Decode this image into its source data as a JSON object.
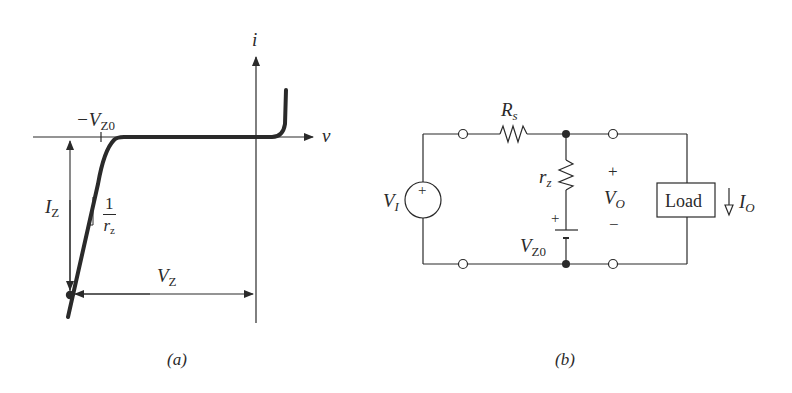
{
  "figure": {
    "panel_a": {
      "caption": "(a)",
      "axis_i_label": "i",
      "axis_v_label": "v",
      "knee_label_prefix": "−V",
      "knee_label_sub": "Z0",
      "current_label": "I",
      "current_label_sub": "Z",
      "slope_numerator": "1",
      "slope_denominator": "r",
      "slope_denominator_sub": "z",
      "voltage_label": "V",
      "voltage_label_sub": "Z"
    },
    "panel_b": {
      "caption": "(b)",
      "series_resistor": "R",
      "series_resistor_sub": "s",
      "zener_resistance": "r",
      "zener_resistance_sub": "z",
      "source_label": "V",
      "source_label_sub": "I",
      "source_sign": "+",
      "battery_label": "V",
      "battery_label_sub": "Z0",
      "battery_sign": "+",
      "output_plus": "+",
      "output_label": "V",
      "output_label_sub": "O",
      "output_minus": "−",
      "load_label": "Load",
      "load_current": "I",
      "load_current_sub": "O"
    }
  },
  "colors": {
    "ink": "#2a2a2a",
    "background": "#ffffff"
  }
}
